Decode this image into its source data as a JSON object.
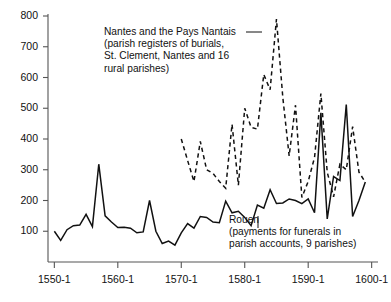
{
  "chart_data": {
    "type": "line",
    "title": "",
    "xlabel": "",
    "ylabel": "",
    "xlim": [
      1549,
      1601
    ],
    "ylim": [
      0,
      800
    ],
    "yticks": [
      100,
      200,
      300,
      400,
      500,
      600,
      700,
      800
    ],
    "xticks": [
      1550,
      1560,
      1570,
      1580,
      1590,
      1600
    ],
    "xtick_labels": [
      "1550-1",
      "1560-1",
      "1570-1",
      "1580-1",
      "1590-1",
      "1600-1"
    ],
    "ytick_labels": [
      "100",
      "200",
      "300",
      "400",
      "500",
      "600",
      "700",
      "800"
    ],
    "grid": false,
    "legend_position": "annotations-inline",
    "series": [
      {
        "name": "Rouen",
        "style": "solid",
        "color": "#111111",
        "annotation": [
          "Rouen",
          "(payments for funerals in",
          "parish accounts, 9 parishes)"
        ],
        "x": [
          1550,
          1551,
          1552,
          1553,
          1554,
          1555,
          1556,
          1557,
          1558,
          1559,
          1560,
          1561,
          1562,
          1563,
          1564,
          1565,
          1566,
          1567,
          1568,
          1569,
          1570,
          1571,
          1572,
          1573,
          1574,
          1575,
          1576,
          1577,
          1578,
          1579,
          1580,
          1581,
          1582,
          1583,
          1584,
          1585,
          1586,
          1587,
          1588,
          1589,
          1590,
          1591,
          1592,
          1593,
          1594,
          1595,
          1596,
          1597,
          1598,
          1599
        ],
        "values": [
          100,
          70,
          105,
          118,
          120,
          155,
          115,
          318,
          150,
          130,
          112,
          113,
          110,
          95,
          98,
          200,
          100,
          60,
          68,
          55,
          95,
          125,
          110,
          148,
          145,
          130,
          128,
          198,
          160,
          165,
          145,
          118,
          185,
          175,
          235,
          190,
          192,
          205,
          200,
          190,
          205,
          160,
          485,
          140,
          278,
          265,
          512,
          148,
          200,
          260
        ]
      },
      {
        "name": "Nantes and the Pays Nantais",
        "style": "dashed",
        "color": "#111111",
        "annotation": [
          "Nantes and the Pays Nantais ——",
          "(parish registers of burials,",
          "St. Clement, Nantes and 16",
          "rural parishes)"
        ],
        "x": [
          1570,
          1571,
          1572,
          1573,
          1574,
          1575,
          1576,
          1577,
          1578,
          1579,
          1580,
          1581,
          1582,
          1583,
          1584,
          1585,
          1586,
          1587,
          1588,
          1589,
          1590,
          1591,
          1592,
          1593,
          1594,
          1595,
          1596,
          1597,
          1598,
          1599
        ],
        "values": [
          400,
          330,
          262,
          392,
          300,
          288,
          262,
          240,
          448,
          250,
          500,
          438,
          432,
          610,
          560,
          790,
          535,
          345,
          510,
          210,
          262,
          340,
          548,
          292,
          212,
          318,
          300,
          440,
          292,
          260
        ]
      }
    ]
  },
  "axes": {
    "y_labels": [
      "800",
      "700",
      "600",
      "500",
      "400",
      "300",
      "200",
      "100"
    ],
    "x_labels": [
      "1550-1",
      "1560-1",
      "1570-1",
      "1580-1",
      "1590-1",
      "1600-1"
    ]
  },
  "annotations": {
    "nantes": {
      "line1": "Nantes and the Pays Nantais",
      "line2": "(parish registers of burials,",
      "line3": "St. Clement, Nantes and 16",
      "line4": "rural parishes)"
    },
    "rouen": {
      "line1": "Rouen",
      "line2": "(payments for funerals in",
      "line3": "parish accounts, 9 parishes)"
    }
  },
  "colors": {
    "axis": "#444444",
    "line": "#111111",
    "background": "#ffffff"
  }
}
